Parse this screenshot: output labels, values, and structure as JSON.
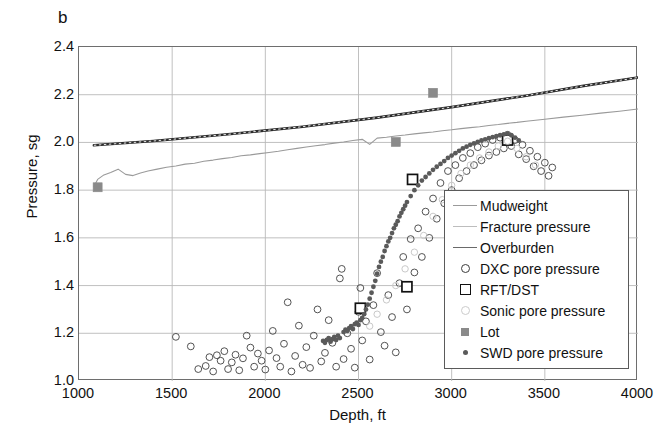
{
  "panel_label": "b",
  "chart_data": {
    "type": "scatter",
    "title": "",
    "xlabel": "Depth, ft",
    "ylabel": "Pressure, sg",
    "xlim": [
      1000,
      4000
    ],
    "ylim": [
      1.0,
      2.4
    ],
    "xticks": [
      1000,
      1500,
      2000,
      2500,
      3000,
      3500,
      4000
    ],
    "yticks": [
      "1.0",
      "1.2",
      "1.4",
      "1.6",
      "1.8",
      "2.0",
      "2.2",
      "2.4"
    ],
    "grid": true,
    "legend_position": "lower-right",
    "series": [
      {
        "name": "Mudweight",
        "type": "line",
        "color": "#9a9a9a",
        "points": [
          [
            1080,
            1.815
          ],
          [
            1100,
            1.845
          ],
          [
            1130,
            1.862
          ],
          [
            1170,
            1.874
          ],
          [
            1210,
            1.888
          ],
          [
            1250,
            1.866
          ],
          [
            1290,
            1.861
          ],
          [
            1330,
            1.872
          ],
          [
            1370,
            1.88
          ],
          [
            1420,
            1.888
          ],
          [
            1470,
            1.896
          ],
          [
            1520,
            1.901
          ],
          [
            1570,
            1.909
          ],
          [
            1620,
            1.913
          ],
          [
            1670,
            1.921
          ],
          [
            1720,
            1.926
          ],
          [
            1770,
            1.932
          ],
          [
            1820,
            1.937
          ],
          [
            1870,
            1.944
          ],
          [
            1920,
            1.948
          ],
          [
            1970,
            1.953
          ],
          [
            2020,
            1.958
          ],
          [
            2070,
            1.963
          ],
          [
            2120,
            1.969
          ],
          [
            2170,
            1.975
          ],
          [
            2220,
            1.981
          ],
          [
            2270,
            1.986
          ],
          [
            2320,
            1.991
          ],
          [
            2370,
            1.997
          ],
          [
            2420,
            2.002
          ],
          [
            2470,
            2.008
          ],
          [
            2520,
            2.013
          ],
          [
            2560,
            1.992
          ],
          [
            2600,
            2.018
          ],
          [
            2650,
            2.022
          ],
          [
            2700,
            2.027
          ],
          [
            2750,
            2.031
          ],
          [
            2800,
            2.036
          ],
          [
            2850,
            2.04
          ],
          [
            2900,
            2.044
          ],
          [
            2950,
            2.049
          ],
          [
            3000,
            2.053
          ],
          [
            3050,
            2.058
          ],
          [
            3100,
            2.062
          ],
          [
            3150,
            2.066
          ],
          [
            3200,
            2.071
          ],
          [
            3250,
            2.075
          ],
          [
            3300,
            2.08
          ],
          [
            3350,
            2.084
          ],
          [
            3400,
            2.089
          ],
          [
            3500,
            2.097
          ],
          [
            3600,
            2.106
          ],
          [
            3700,
            2.114
          ],
          [
            3800,
            2.123
          ],
          [
            3900,
            2.131
          ],
          [
            4000,
            2.14
          ]
        ]
      },
      {
        "name": "Fracture pressure",
        "type": "line",
        "color": "#b3b3b3",
        "points": [
          [
            1080,
            1.99
          ],
          [
            1300,
            2.002
          ],
          [
            1600,
            2.02
          ],
          [
            1900,
            2.041
          ],
          [
            2200,
            2.065
          ],
          [
            2500,
            2.092
          ],
          [
            2800,
            2.124
          ],
          [
            3100,
            2.16
          ],
          [
            3400,
            2.198
          ],
          [
            3700,
            2.236
          ],
          [
            4000,
            2.272
          ]
        ]
      },
      {
        "name": "Overburden",
        "type": "line",
        "color": "#2b2b2b",
        "points": [
          [
            1080,
            1.988
          ],
          [
            1400,
            2.006
          ],
          [
            1800,
            2.034
          ],
          [
            2200,
            2.066
          ],
          [
            2600,
            2.104
          ],
          [
            3000,
            2.148
          ],
          [
            3400,
            2.196
          ],
          [
            3700,
            2.236
          ],
          [
            4000,
            2.272
          ]
        ]
      },
      {
        "name": "DXC pore pressure",
        "type": "scatter",
        "marker": "open-circle",
        "color": "#4a4a4a",
        "points": [
          [
            1520,
            1.185
          ],
          [
            1600,
            1.145
          ],
          [
            1640,
            1.05
          ],
          [
            1680,
            1.063
          ],
          [
            1700,
            1.1
          ],
          [
            1720,
            1.04
          ],
          [
            1740,
            1.108
          ],
          [
            1760,
            1.085
          ],
          [
            1780,
            1.125
          ],
          [
            1800,
            1.05
          ],
          [
            1820,
            1.078
          ],
          [
            1840,
            1.11
          ],
          [
            1860,
            1.045
          ],
          [
            1880,
            1.095
          ],
          [
            1900,
            1.19
          ],
          [
            1920,
            1.14
          ],
          [
            1940,
            1.06
          ],
          [
            1960,
            1.115
          ],
          [
            1980,
            1.085
          ],
          [
            2000,
            1.048
          ],
          [
            2020,
            1.128
          ],
          [
            2040,
            1.21
          ],
          [
            2060,
            1.096
          ],
          [
            2080,
            1.06
          ],
          [
            2100,
            1.156
          ],
          [
            2120,
            1.33
          ],
          [
            2140,
            1.04
          ],
          [
            2160,
            1.105
          ],
          [
            2180,
            1.232
          ],
          [
            2200,
            1.068
          ],
          [
            2220,
            1.142
          ],
          [
            2240,
            1.055
          ],
          [
            2260,
            1.19
          ],
          [
            2280,
            1.3
          ],
          [
            2300,
            1.082
          ],
          [
            2320,
            1.118
          ],
          [
            2340,
            1.255
          ],
          [
            2360,
            1.16
          ],
          [
            2380,
            1.06
          ],
          [
            2400,
            1.43
          ],
          [
            2410,
            1.47
          ],
          [
            2420,
            1.092
          ],
          [
            2440,
            1.2
          ],
          [
            2460,
            1.135
          ],
          [
            2480,
            1.056
          ],
          [
            2500,
            1.29
          ],
          [
            2510,
            1.39
          ],
          [
            2520,
            1.17
          ],
          [
            2540,
            1.25
          ],
          [
            2560,
            1.09
          ],
          [
            2580,
            1.318
          ],
          [
            2600,
            1.452
          ],
          [
            2620,
            1.205
          ],
          [
            2640,
            1.148
          ],
          [
            2660,
            1.36
          ],
          [
            2680,
            1.268
          ],
          [
            2700,
            1.12
          ],
          [
            2720,
            1.41
          ],
          [
            2740,
            1.52
          ],
          [
            2760,
            1.3
          ],
          [
            2780,
            1.595
          ],
          [
            2800,
            1.455
          ],
          [
            2820,
            1.64
          ],
          [
            2840,
            1.52
          ],
          [
            2860,
            1.71
          ],
          [
            2880,
            1.6
          ],
          [
            2900,
            1.765
          ],
          [
            2920,
            1.68
          ],
          [
            2940,
            1.83
          ],
          [
            2960,
            1.745
          ],
          [
            2980,
            1.88
          ],
          [
            3000,
            1.8
          ],
          [
            3020,
            1.905
          ],
          [
            3040,
            1.85
          ],
          [
            3060,
            1.935
          ],
          [
            3080,
            1.88
          ],
          [
            3100,
            1.955
          ],
          [
            3120,
            1.905
          ],
          [
            3140,
            1.98
          ],
          [
            3160,
            1.925
          ],
          [
            3180,
            1.995
          ],
          [
            3200,
            1.945
          ],
          [
            3220,
            2.01
          ],
          [
            3240,
            1.96
          ],
          [
            3260,
            2.02
          ],
          [
            3280,
            1.975
          ],
          [
            3300,
            2.032
          ],
          [
            3320,
            1.985
          ],
          [
            3340,
            2.01
          ],
          [
            3360,
            1.95
          ],
          [
            3380,
            1.99
          ],
          [
            3400,
            1.93
          ],
          [
            3420,
            1.965
          ],
          [
            3440,
            1.9
          ],
          [
            3460,
            1.94
          ],
          [
            3480,
            1.88
          ],
          [
            3500,
            1.915
          ],
          [
            3520,
            1.86
          ],
          [
            3540,
            1.895
          ]
        ]
      },
      {
        "name": "RFT/DST",
        "type": "scatter",
        "marker": "open-square",
        "color": "#111111",
        "points": [
          [
            2510,
            1.305
          ],
          [
            2760,
            1.395
          ],
          [
            2790,
            1.845
          ],
          [
            3300,
            2.01
          ]
        ]
      },
      {
        "name": "Sonic pore pressure",
        "type": "scatter",
        "marker": "light-circle",
        "color": "#c9c9c9",
        "points": [
          [
            2560,
            1.23
          ],
          [
            2600,
            1.28
          ],
          [
            2650,
            1.34
          ],
          [
            2700,
            1.4
          ],
          [
            2750,
            1.47
          ],
          [
            2800,
            1.54
          ],
          [
            2850,
            1.61
          ],
          [
            2900,
            1.69
          ],
          [
            2950,
            1.76
          ],
          [
            3000,
            1.82
          ],
          [
            3050,
            1.87
          ],
          [
            3100,
            1.905
          ],
          [
            3150,
            1.935
          ],
          [
            3200,
            1.96
          ],
          [
            3250,
            1.985
          ],
          [
            3300,
            2.005
          ],
          [
            3350,
            1.975
          ],
          [
            3400,
            1.94
          ],
          [
            3450,
            1.905
          ]
        ]
      },
      {
        "name": "Lot",
        "type": "scatter",
        "marker": "filled-square",
        "color": "#8a8a8a",
        "points": [
          [
            1100,
            1.812
          ],
          [
            2700,
            2.002
          ],
          [
            2900,
            2.208
          ]
        ]
      },
      {
        "name": "SWD pore pressure",
        "type": "scatter",
        "marker": "filled-dot",
        "color": "#5a5a5a",
        "points": [
          [
            2310,
            1.168
          ],
          [
            2320,
            1.16
          ],
          [
            2330,
            1.172
          ],
          [
            2340,
            1.18
          ],
          [
            2350,
            1.165
          ],
          [
            2360,
            1.175
          ],
          [
            2370,
            1.185
          ],
          [
            2380,
            1.172
          ],
          [
            2390,
            1.19
          ],
          [
            2400,
            1.18
          ],
          [
            2420,
            1.205
          ],
          [
            2430,
            1.215
          ],
          [
            2440,
            1.21
          ],
          [
            2450,
            1.222
          ],
          [
            2460,
            1.23
          ],
          [
            2470,
            1.218
          ],
          [
            2480,
            1.238
          ],
          [
            2490,
            1.245
          ],
          [
            2500,
            1.235
          ],
          [
            2510,
            1.255
          ],
          [
            2520,
            1.265
          ],
          [
            2530,
            1.28
          ],
          [
            2540,
            1.3
          ],
          [
            2550,
            1.32
          ],
          [
            2560,
            1.345
          ],
          [
            2570,
            1.37
          ],
          [
            2580,
            1.395
          ],
          [
            2590,
            1.42
          ],
          [
            2600,
            1.45
          ],
          [
            2610,
            1.478
          ],
          [
            2620,
            1.5
          ],
          [
            2630,
            1.52
          ],
          [
            2640,
            1.545
          ],
          [
            2650,
            1.565
          ],
          [
            2660,
            1.585
          ],
          [
            2670,
            1.6
          ],
          [
            2680,
            1.62
          ],
          [
            2690,
            1.64
          ],
          [
            2700,
            1.655
          ],
          [
            2710,
            1.67
          ],
          [
            2720,
            1.69
          ],
          [
            2730,
            1.705
          ],
          [
            2740,
            1.72
          ],
          [
            2750,
            1.735
          ],
          [
            2760,
            1.75
          ],
          [
            2780,
            1.775
          ],
          [
            2800,
            1.8
          ],
          [
            2820,
            1.82
          ],
          [
            2840,
            1.84
          ],
          [
            2860,
            1.855
          ],
          [
            2880,
            1.87
          ],
          [
            2900,
            1.885
          ],
          [
            2920,
            1.898
          ],
          [
            2940,
            1.91
          ],
          [
            2960,
            1.922
          ],
          [
            2980,
            1.935
          ],
          [
            3000,
            1.945
          ],
          [
            3020,
            1.955
          ],
          [
            3040,
            1.965
          ],
          [
            3060,
            1.975
          ],
          [
            3080,
            1.982
          ],
          [
            3100,
            1.99
          ],
          [
            3120,
            1.996
          ],
          [
            3140,
            2.002
          ],
          [
            3160,
            2.008
          ],
          [
            3180,
            2.013
          ],
          [
            3200,
            2.018
          ],
          [
            3220,
            2.022
          ],
          [
            3240,
            2.026
          ],
          [
            3260,
            2.03
          ],
          [
            3280,
            2.034
          ],
          [
            3300,
            2.037
          ],
          [
            3320,
            2.03
          ],
          [
            3340,
            2.02
          ],
          [
            3360,
            2.008
          ]
        ]
      }
    ]
  },
  "legend": {
    "items": [
      {
        "label": "Mudweight",
        "key": "line",
        "color": "#9a9a9a"
      },
      {
        "label": "Fracture pressure",
        "key": "line",
        "color": "#bdbdbd"
      },
      {
        "label": "Overburden",
        "key": "line",
        "color": "#6a6a6a"
      },
      {
        "label": "DXC pore pressure",
        "key": "open-circle",
        "color": "#3c3c3c"
      },
      {
        "label": "RFT/DST",
        "key": "open-square",
        "color": "#111111"
      },
      {
        "label": "Sonic pore pressure",
        "key": "light-circle",
        "color": "#cccccc"
      },
      {
        "label": "Lot",
        "key": "filled-square",
        "color": "#8a8a8a"
      },
      {
        "label": "SWD pore pressure",
        "key": "filled-dot",
        "color": "#5a5a5a"
      }
    ]
  }
}
